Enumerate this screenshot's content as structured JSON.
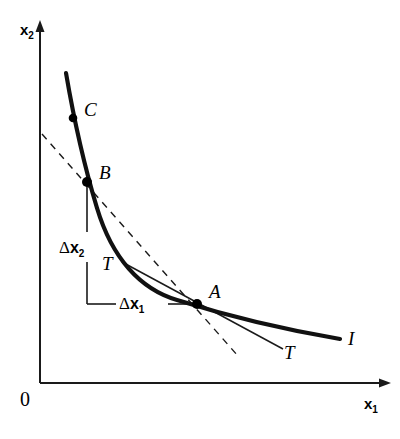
{
  "figure": {
    "background_color": "#ffffff",
    "line_color": "#1a1a1a",
    "width": 400,
    "height": 439
  },
  "axes": {
    "y_label": "x",
    "y_label_sub": "2",
    "x_label": "x",
    "x_label_sub": "1",
    "origin_label": "0",
    "x_axis_y": 383,
    "y_axis_x": 40,
    "x_axis_end": 390,
    "y_axis_top": 22
  },
  "points": [
    {
      "id": "C",
      "label": "C",
      "x": 73,
      "y": 118,
      "label_x": 84,
      "label_y": 100
    },
    {
      "id": "B",
      "label": "B",
      "x": 87,
      "y": 182,
      "label_x": 99,
      "label_y": 163
    },
    {
      "id": "A",
      "label": "A",
      "x": 197,
      "y": 304,
      "label_x": 209,
      "label_y": 282
    }
  ],
  "curve": {
    "name": "indifference-curve",
    "label": "I",
    "label_x": 348,
    "label_y": 329,
    "path": "M 66,73 C 74,120 84,165 97,208 C 112,258 140,289 177,300 C 215,312 275,328 340,339"
  },
  "tangent": {
    "name": "tangent-line",
    "label_upper": "T",
    "label_upper_x": 102,
    "label_upper_y": 254,
    "label_lower": "T",
    "label_lower_x": 284,
    "label_lower_y": 343,
    "path": "M 122,262 L 282,348"
  },
  "secant": {
    "name": "secant-line-dashed",
    "path": "M 42,134 L 238,356",
    "dash": "7,6"
  },
  "deltas": [
    {
      "id": "delta-x2",
      "symbol": "Δ",
      "var": "x",
      "sub": "2",
      "label_x": 59,
      "label_y": 247,
      "line": "vertical",
      "line_x": 87,
      "line_y1": 182,
      "line_y2": 304
    },
    {
      "id": "delta-x1",
      "symbol": "Δ",
      "var": "x",
      "sub": "1",
      "label_x": 119,
      "label_y": 295,
      "line": "horizontal",
      "line_y": 304,
      "line_x1": 87,
      "line_x2": 197
    }
  ],
  "origin": {
    "label": "0",
    "x": 20,
    "y": 391
  }
}
